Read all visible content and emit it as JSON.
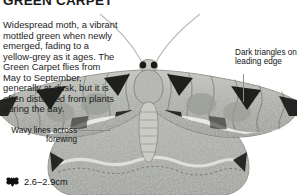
{
  "page": {
    "title": "GREEN CARPET",
    "background_color": "#ffffff",
    "text_color": "#1d1d1d"
  },
  "body": {
    "description": "Widespread moth, a vibrant mottled green when newly emerged, fading to a yellow-grey as it ages. The Green Carpet flies from May to September, generally at dusk, but it is often disturbed from plants during the day."
  },
  "callouts": {
    "dark_triangles": {
      "label": "Dark triangles on leading edge"
    },
    "wavy_lines": {
      "label": "Wavy lines across forewing"
    }
  },
  "size": {
    "icon": "moth-silhouette-icon",
    "value": "2.6–2.9cm"
  }
}
